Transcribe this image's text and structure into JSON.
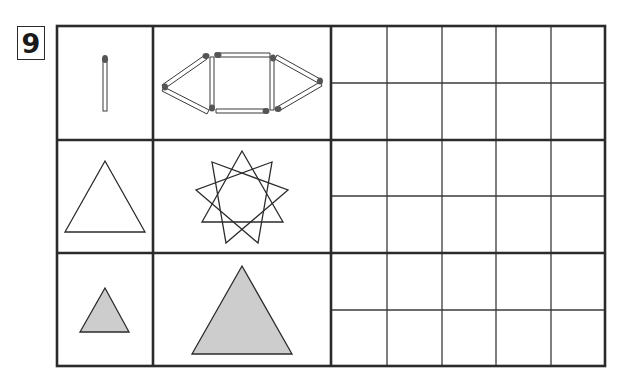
{
  "question": {
    "number": "9"
  },
  "colors": {
    "line": "#2b2b2b",
    "shape_fill_gray": "#cdcdcd",
    "match_head": "#555555",
    "background": "#ffffff"
  },
  "rows": [
    {
      "left_figure": "single-matchstick",
      "right_figure": "matchstick-hexagon-shape (square with triangles on both sides)",
      "answer_boxes": 10
    },
    {
      "left_figure": "outline-triangle",
      "right_figure": "nine-point-star (three overlapping triangles)",
      "answer_boxes": 10
    },
    {
      "left_figure": "small-gray-triangle",
      "right_figure": "large-gray-triangle",
      "answer_boxes": 10
    }
  ],
  "answer_grid": {
    "columns": 5,
    "rows": 6
  }
}
